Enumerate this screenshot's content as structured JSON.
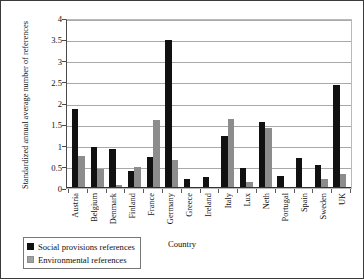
{
  "chart_data": {
    "type": "bar",
    "title": "",
    "xlabel": "Country",
    "ylabel": "Standardized annual average number of references",
    "ylim": [
      0,
      4
    ],
    "yticks": [
      "0",
      "0.5",
      "1",
      "1.5",
      "2",
      "2.5",
      "3",
      "3.5",
      "4"
    ],
    "grid": true,
    "legend_position": "bottom-left",
    "categories": [
      "Austria",
      "Belgium",
      "Denmark",
      "Finland",
      "France",
      "Germany",
      "Greece",
      "Ireland",
      "Italy",
      "Lux",
      "Neth",
      "Portugal",
      "Spain",
      "Sweden",
      "UK"
    ],
    "series": [
      {
        "name": "Social provisions references",
        "color": "#111111",
        "values": [
          1.87,
          0.97,
          0.91,
          0.4,
          0.73,
          3.48,
          0.21,
          0.27,
          1.22,
          0.48,
          1.55,
          0.28,
          0.7,
          0.55,
          2.43
        ]
      },
      {
        "name": "Environmental references",
        "color": "#8c8c8c",
        "values": [
          0.75,
          0.44,
          0.08,
          0.49,
          1.6,
          0.66,
          0.0,
          0.0,
          1.62,
          0.13,
          1.42,
          0.0,
          0.0,
          0.22,
          0.33
        ]
      }
    ]
  },
  "legend": {
    "items": [
      {
        "label": "Social provisions references",
        "swatch": "social"
      },
      {
        "label": "Environmental references",
        "swatch": "env"
      }
    ]
  }
}
